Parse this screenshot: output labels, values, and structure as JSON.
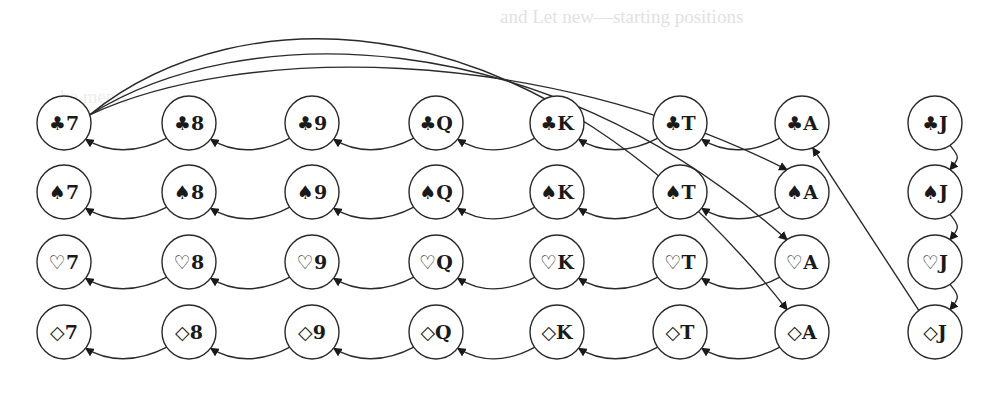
{
  "background_text": {
    "line1": "and Let new—starting positions",
    "line2": "be    ments"
  },
  "diagram": {
    "columns": [
      "7",
      "8",
      "9",
      "Q",
      "K",
      "T",
      "A",
      "J"
    ],
    "rows": [
      {
        "suit": "clubs",
        "glyph": "♣"
      },
      {
        "suit": "spades",
        "glyph": "♠"
      },
      {
        "suit": "hearts",
        "glyph": "♡"
      },
      {
        "suit": "diamonds",
        "glyph": "◇"
      }
    ],
    "nodes": [
      {
        "id": "C7",
        "label": "♣7"
      },
      {
        "id": "C8",
        "label": "♣8"
      },
      {
        "id": "C9",
        "label": "♣9"
      },
      {
        "id": "CQ",
        "label": "♣Q"
      },
      {
        "id": "CK",
        "label": "♣K"
      },
      {
        "id": "CT",
        "label": "♣T"
      },
      {
        "id": "CA",
        "label": "♣A"
      },
      {
        "id": "CJ",
        "label": "♣J"
      },
      {
        "id": "S7",
        "label": "♠7"
      },
      {
        "id": "S8",
        "label": "♠8"
      },
      {
        "id": "S9",
        "label": "♠9"
      },
      {
        "id": "SQ",
        "label": "♠Q"
      },
      {
        "id": "SK",
        "label": "♠K"
      },
      {
        "id": "ST",
        "label": "♠T"
      },
      {
        "id": "SA",
        "label": "♠A"
      },
      {
        "id": "SJ",
        "label": "♠J"
      },
      {
        "id": "H7",
        "label": "♡7"
      },
      {
        "id": "H8",
        "label": "♡8"
      },
      {
        "id": "H9",
        "label": "♡9"
      },
      {
        "id": "HQ",
        "label": "♡Q"
      },
      {
        "id": "HK",
        "label": "♡K"
      },
      {
        "id": "HT",
        "label": "♡T"
      },
      {
        "id": "HA",
        "label": "♡A"
      },
      {
        "id": "HJ",
        "label": "♡J"
      },
      {
        "id": "D7",
        "label": "◇7"
      },
      {
        "id": "D8",
        "label": "◇8"
      },
      {
        "id": "D9",
        "label": "◇9"
      },
      {
        "id": "DQ",
        "label": "◇Q"
      },
      {
        "id": "DK",
        "label": "◇K"
      },
      {
        "id": "DT",
        "label": "◇T"
      },
      {
        "id": "DA",
        "label": "◇A"
      },
      {
        "id": "DJ",
        "label": "◇J"
      }
    ],
    "edges": [
      {
        "from": "C8",
        "to": "C7"
      },
      {
        "from": "C9",
        "to": "C8"
      },
      {
        "from": "CQ",
        "to": "C9"
      },
      {
        "from": "CK",
        "to": "CQ"
      },
      {
        "from": "CT",
        "to": "CK"
      },
      {
        "from": "CA",
        "to": "CT"
      },
      {
        "from": "S8",
        "to": "S7"
      },
      {
        "from": "S9",
        "to": "S8"
      },
      {
        "from": "SQ",
        "to": "S9"
      },
      {
        "from": "SK",
        "to": "SQ"
      },
      {
        "from": "ST",
        "to": "SK"
      },
      {
        "from": "SA",
        "to": "ST"
      },
      {
        "from": "H8",
        "to": "H7"
      },
      {
        "from": "H9",
        "to": "H8"
      },
      {
        "from": "HQ",
        "to": "H9"
      },
      {
        "from": "HK",
        "to": "HQ"
      },
      {
        "from": "HT",
        "to": "HK"
      },
      {
        "from": "HA",
        "to": "HT"
      },
      {
        "from": "D8",
        "to": "D7"
      },
      {
        "from": "D9",
        "to": "D8"
      },
      {
        "from": "DQ",
        "to": "D9"
      },
      {
        "from": "DK",
        "to": "DQ"
      },
      {
        "from": "DT",
        "to": "DK"
      },
      {
        "from": "DA",
        "to": "DT"
      },
      {
        "from": "CJ",
        "to": "SJ"
      },
      {
        "from": "SJ",
        "to": "HJ"
      },
      {
        "from": "HJ",
        "to": "DJ"
      },
      {
        "from": "C7",
        "to": "SA"
      },
      {
        "from": "C7",
        "to": "HA"
      },
      {
        "from": "C7",
        "to": "DA"
      },
      {
        "from": "DJ",
        "to": "CA"
      }
    ]
  },
  "colors": {
    "stroke": "#2a2a2a",
    "text": "#1a1a1a",
    "background": "#ffffff",
    "ghost_text": "#c9c9c9"
  }
}
